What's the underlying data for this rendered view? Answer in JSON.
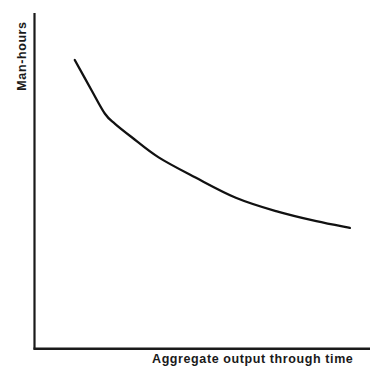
{
  "chart_data": {
    "type": "line",
    "title": "",
    "subtitle": "",
    "xlabel": "Aggregate output through time",
    "ylabel": "Man-hours",
    "annotations": [],
    "legend": [],
    "legend_position": "none",
    "grid": false,
    "axis_ticks": "none",
    "tick_labels": {
      "x": [],
      "y": []
    },
    "xlim": [
      0,
      1
    ],
    "ylim": [
      0,
      1
    ],
    "series": [
      {
        "name": "Learning curve",
        "description": "Man-hours per unit decline at a decreasing rate as aggregate output accumulates",
        "x": [
          0.12,
          0.17,
          0.21,
          0.24,
          0.29,
          0.37,
          0.48,
          0.6,
          0.72,
          0.84,
          0.94
        ],
        "y": [
          0.86,
          0.77,
          0.7,
          0.67,
          0.63,
          0.57,
          0.51,
          0.45,
          0.41,
          0.38,
          0.36
        ]
      }
    ],
    "colors": {
      "background": "#ffffff",
      "axis": "#1a1a1a",
      "curve": "#111111",
      "text": "#1a1a1a"
    }
  },
  "axes": {
    "y_label_text": "Man-hours",
    "x_label_text": "Aggregate output through time"
  }
}
